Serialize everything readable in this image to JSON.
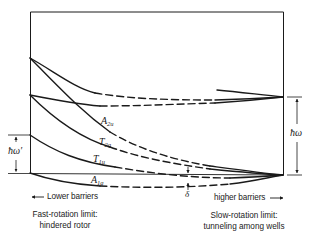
{
  "diagram": {
    "type": "energy-level correlation diagram",
    "colors": {
      "line": "#1a1a1a",
      "background": "#ffffff"
    },
    "levels": [
      {
        "label": "A",
        "sub": "2u"
      },
      {
        "label": "T",
        "sub": "2g"
      },
      {
        "label": "T",
        "sub": "1u"
      },
      {
        "label": "A",
        "sub": "1g"
      }
    ],
    "spacing_labels": {
      "left": "ħω′",
      "right": "ħω",
      "splitting": "δ"
    },
    "direction_labels": {
      "left": "Lower barriers",
      "right": "higher barriers"
    },
    "limits": {
      "left_line1": "Fast-rotation limit:",
      "left_line2": "hindered rotor",
      "right_line1": "Slow-rotation limit:",
      "right_line2": "tunneling among wells"
    }
  }
}
